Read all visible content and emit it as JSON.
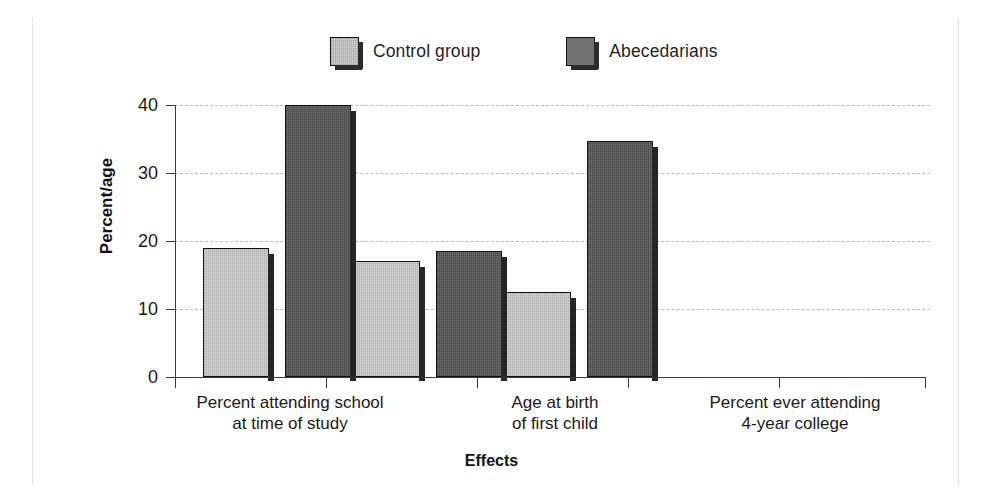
{
  "figure": {
    "width": 983,
    "height": 500,
    "background": "#ffffff"
  },
  "legend": {
    "position": "top-center",
    "items": [
      {
        "label": "Control group",
        "color": "#d4d4d4",
        "swatch_icon": "legend-swatch-icon"
      },
      {
        "label": "Abecedarians",
        "color": "#6f6f6f",
        "swatch_icon": "legend-swatch-icon"
      }
    ]
  },
  "axes": {
    "y_title": "Percent/age",
    "x_title": "Effects",
    "y_ticks": [
      "0",
      "10",
      "20",
      "30",
      "40"
    ]
  },
  "chart_data": {
    "type": "bar",
    "title": "",
    "subtitle": "",
    "xlabel": "Effects",
    "ylabel": "Percent/age",
    "ylim": [
      0,
      40
    ],
    "yticks": [
      0,
      10,
      20,
      30,
      40
    ],
    "grid": true,
    "legend_position": "top-center",
    "categories": [
      "Percent attending school\nat time of study",
      "Age at birth\nof first child",
      "Percent ever attending\n4-year college"
    ],
    "series": [
      {
        "name": "Control group",
        "color": "#d4d4d4",
        "values": [
          19,
          17,
          12.5
        ]
      },
      {
        "name": "Abecedarians",
        "color": "#6f6f6f",
        "values": [
          40,
          18.5,
          34.7
        ]
      }
    ]
  }
}
